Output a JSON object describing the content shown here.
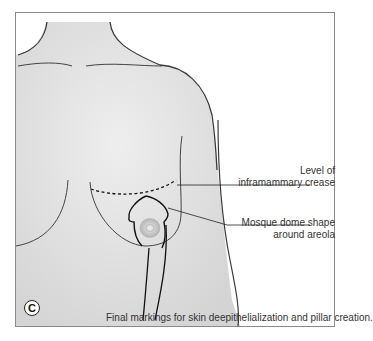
{
  "figure": {
    "panel_letter": "C",
    "caption": "Final markings for skin deepithelialization and pillar creation.",
    "labels": [
      {
        "id": "inframammary",
        "lines": [
          "Level of",
          "inframammary crease"
        ]
      },
      {
        "id": "mosque",
        "lines": [
          "Mosque dome shape",
          "around areola"
        ]
      }
    ],
    "colors": {
      "skin": "#e4e4e4",
      "outline": "#3a3a3a",
      "frame": "#8a8a8a"
    }
  }
}
